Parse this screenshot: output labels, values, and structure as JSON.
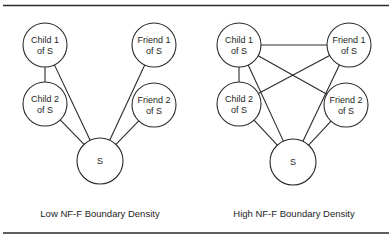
{
  "figure": {
    "panels": [
      {
        "id": "low",
        "caption": "Low NF-F Boundary Density",
        "caption_pos": [
          100,
          217
        ],
        "nodes": [
          {
            "id": "c1",
            "line1": "Child 1",
            "line2": "of S",
            "cx": 45,
            "cy": 45,
            "r": 22
          },
          {
            "id": "c2",
            "line1": "Child 2",
            "line2": "of S",
            "cx": 45,
            "cy": 104,
            "r": 22
          },
          {
            "id": "f1",
            "line1": "Friend 1",
            "line2": "of S",
            "cx": 154,
            "cy": 45,
            "r": 22
          },
          {
            "id": "f2",
            "line1": "Friend 2",
            "line2": "of S",
            "cx": 154,
            "cy": 105,
            "r": 22
          },
          {
            "id": "s",
            "line1": "S",
            "line2": "",
            "cx": 100,
            "cy": 161,
            "r": 23
          }
        ],
        "edges": [
          [
            "c1",
            "c2"
          ],
          [
            "c1",
            "s"
          ],
          [
            "c2",
            "s"
          ],
          [
            "f1",
            "s"
          ],
          [
            "f2",
            "s"
          ]
        ]
      },
      {
        "id": "high",
        "caption": "High NF-F Boundary Density",
        "caption_pos": [
          294,
          217
        ],
        "nodes": [
          {
            "id": "c1",
            "line1": "Child 1",
            "line2": "of S",
            "cx": 239,
            "cy": 45,
            "r": 22
          },
          {
            "id": "c2",
            "line1": "Child 2",
            "line2": "of S",
            "cx": 239,
            "cy": 104,
            "r": 22
          },
          {
            "id": "f1",
            "line1": "Friend 1",
            "line2": "of S",
            "cx": 349,
            "cy": 45,
            "r": 22
          },
          {
            "id": "f2",
            "line1": "Friend 2",
            "line2": "of S",
            "cx": 346,
            "cy": 105,
            "r": 22
          },
          {
            "id": "s",
            "line1": "S",
            "line2": "",
            "cx": 293,
            "cy": 162,
            "r": 23
          }
        ],
        "edges": [
          [
            "c1",
            "c2"
          ],
          [
            "c1",
            "f1"
          ],
          [
            "c1",
            "f2"
          ],
          [
            "c2",
            "f1"
          ],
          [
            "c1",
            "s"
          ],
          [
            "c2",
            "s"
          ],
          [
            "f1",
            "s"
          ],
          [
            "f2",
            "s"
          ]
        ]
      }
    ]
  }
}
